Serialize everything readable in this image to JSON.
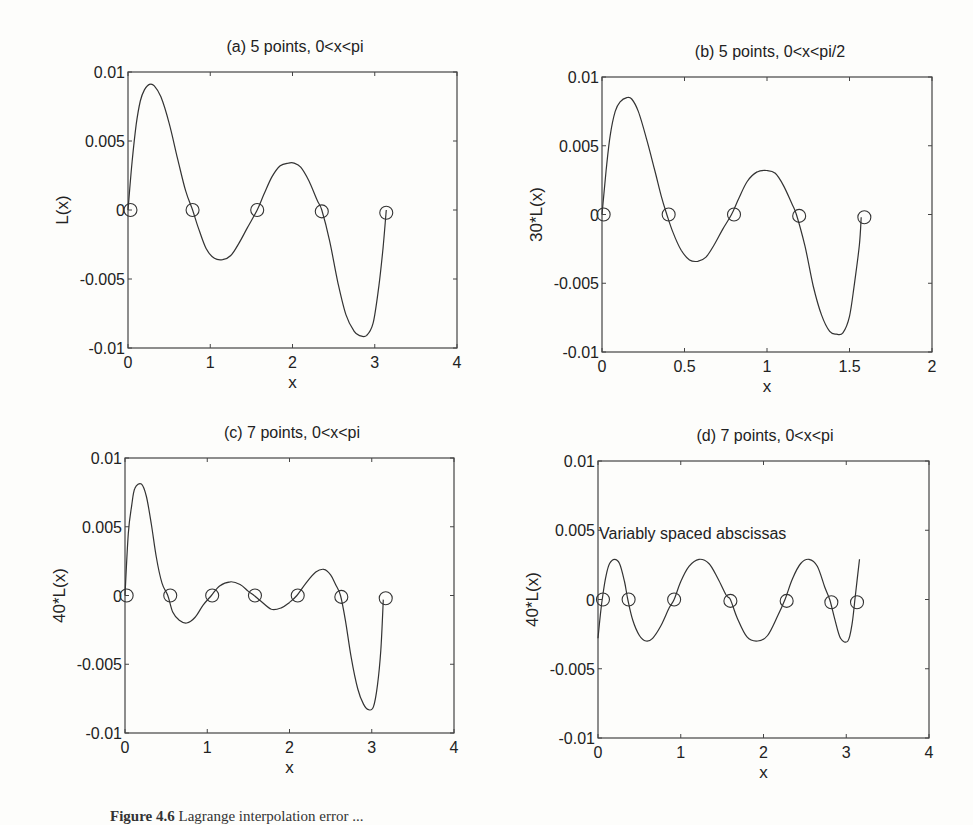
{
  "chart_data": [
    {
      "id": "a",
      "type": "line",
      "title": "(a) 5 points, 0<x<pi",
      "xlabel": "x",
      "ylabel": "L(x)",
      "xlim": [
        0,
        4
      ],
      "ylim": [
        -0.01,
        0.01
      ],
      "xticks": [
        0,
        1,
        2,
        3,
        4
      ],
      "xtick_labels": [
        "0",
        "1",
        "2",
        "3",
        "4"
      ],
      "yticks": [
        -0.01,
        -0.005,
        0,
        0.005,
        0.01
      ],
      "ytick_labels": [
        "-0.01",
        "-0.005",
        "0",
        "0.005",
        "0.01"
      ],
      "grid": false,
      "box": {
        "left": 128,
        "top": 72,
        "right": 457,
        "bottom": 348
      },
      "title_pos": {
        "x": 295,
        "y": 52
      },
      "series": [
        {
          "name": "L(x)",
          "style": "line",
          "points": [
            [
              0,
              0
            ],
            [
              0.05,
              0.0035
            ],
            [
              0.1,
              0.0062
            ],
            [
              0.15,
              0.0079
            ],
            [
              0.2,
              0.0087
            ],
            [
              0.26,
              0.0091
            ],
            [
              0.32,
              0.009
            ],
            [
              0.4,
              0.0082
            ],
            [
              0.5,
              0.0063
            ],
            [
              0.6,
              0.0038
            ],
            [
              0.7,
              0.0014
            ],
            [
              0.785,
              0
            ],
            [
              0.85,
              -0.0012
            ],
            [
              0.95,
              -0.0028
            ],
            [
              1.05,
              -0.0035
            ],
            [
              1.15,
              -0.0036
            ],
            [
              1.25,
              -0.0033
            ],
            [
              1.35,
              -0.0024
            ],
            [
              1.45,
              -0.0013
            ],
            [
              1.571,
              0
            ],
            [
              1.65,
              0.0011
            ],
            [
              1.75,
              0.0024
            ],
            [
              1.85,
              0.0032
            ],
            [
              1.95,
              0.0034
            ],
            [
              2.02,
              0.0034
            ],
            [
              2.1,
              0.0031
            ],
            [
              2.2,
              0.0021
            ],
            [
              2.3,
              0.0007
            ],
            [
              2.356,
              0
            ],
            [
              2.45,
              -0.0022
            ],
            [
              2.55,
              -0.0052
            ],
            [
              2.65,
              -0.0076
            ],
            [
              2.75,
              -0.0088
            ],
            [
              2.82,
              -0.0091
            ],
            [
              2.9,
              -0.0091
            ],
            [
              2.98,
              -0.0082
            ],
            [
              3.05,
              -0.0055
            ],
            [
              3.1,
              -0.0028
            ],
            [
              3.14,
              0
            ]
          ]
        },
        {
          "name": "nodes",
          "style": "marker-circle",
          "points": [
            [
              0.03,
              0
            ],
            [
              0.785,
              0
            ],
            [
              1.571,
              0
            ],
            [
              2.356,
              -0.0001
            ],
            [
              3.14,
              -0.0002
            ]
          ]
        }
      ]
    },
    {
      "id": "b",
      "type": "line",
      "title": "(b) 5 points, 0<x<pi/2",
      "xlabel": "x",
      "ylabel": "30*L(x)",
      "xlim": [
        0,
        2
      ],
      "ylim": [
        -0.01,
        0.01
      ],
      "xticks": [
        0,
        0.5,
        1,
        1.5,
        2
      ],
      "xtick_labels": [
        "0",
        "0.5",
        "1",
        "1.5",
        "2"
      ],
      "yticks": [
        -0.01,
        -0.005,
        0,
        0.005,
        0.01
      ],
      "ytick_labels": [
        "-0.01",
        "-0.005",
        "0",
        "0.005",
        "0.01"
      ],
      "grid": false,
      "box": {
        "left": 602,
        "top": 77,
        "right": 932,
        "bottom": 352
      },
      "title_pos": {
        "x": 770,
        "y": 57
      },
      "series": [
        {
          "name": "30*L(x)",
          "style": "line",
          "points": [
            [
              0,
              0
            ],
            [
              0.025,
              0.0032
            ],
            [
              0.05,
              0.0058
            ],
            [
              0.08,
              0.0075
            ],
            [
              0.11,
              0.0082
            ],
            [
              0.15,
              0.0085
            ],
            [
              0.18,
              0.0084
            ],
            [
              0.22,
              0.0075
            ],
            [
              0.27,
              0.0055
            ],
            [
              0.32,
              0.0032
            ],
            [
              0.36,
              0.0013
            ],
            [
              0.393,
              0
            ],
            [
              0.43,
              -0.0013
            ],
            [
              0.48,
              -0.0026
            ],
            [
              0.53,
              -0.0033
            ],
            [
              0.58,
              -0.0034
            ],
            [
              0.63,
              -0.0031
            ],
            [
              0.68,
              -0.0022
            ],
            [
              0.73,
              -0.0011
            ],
            [
              0.785,
              0
            ],
            [
              0.83,
              0.0012
            ],
            [
              0.88,
              0.0024
            ],
            [
              0.94,
              0.0031
            ],
            [
              1.0,
              0.0032
            ],
            [
              1.05,
              0.003
            ],
            [
              1.1,
              0.0021
            ],
            [
              1.15,
              0.0008
            ],
            [
              1.178,
              0
            ],
            [
              1.23,
              -0.0023
            ],
            [
              1.28,
              -0.0052
            ],
            [
              1.33,
              -0.0073
            ],
            [
              1.38,
              -0.0085
            ],
            [
              1.42,
              -0.0087
            ],
            [
              1.46,
              -0.0086
            ],
            [
              1.5,
              -0.0074
            ],
            [
              1.53,
              -0.005
            ],
            [
              1.56,
              -0.0022
            ],
            [
              1.571,
              -0.0002
            ]
          ]
        },
        {
          "name": "nodes",
          "style": "marker-circle",
          "points": [
            [
              0.01,
              0
            ],
            [
              0.404,
              0
            ],
            [
              0.8,
              0
            ],
            [
              1.195,
              -0.0001
            ],
            [
              1.59,
              -0.0002
            ]
          ]
        }
      ]
    },
    {
      "id": "c",
      "type": "line",
      "title": "(c) 7 points, 0<x<pi",
      "xlabel": "x",
      "ylabel": "40*L(x)",
      "xlim": [
        0,
        4
      ],
      "ylim": [
        -0.01,
        0.01
      ],
      "xticks": [
        0,
        1,
        2,
        3,
        4
      ],
      "xtick_labels": [
        "0",
        "1",
        "2",
        "3",
        "4"
      ],
      "yticks": [
        -0.01,
        -0.005,
        0,
        0.005,
        0.01
      ],
      "ytick_labels": [
        "-0.01",
        "-0.005",
        "0",
        "0.005",
        "0.01"
      ],
      "grid": false,
      "box": {
        "left": 125,
        "top": 458,
        "right": 454,
        "bottom": 733
      },
      "title_pos": {
        "x": 292,
        "y": 438
      },
      "series": [
        {
          "name": "40*L(x)",
          "style": "line",
          "points": [
            [
              0,
              0
            ],
            [
              0.04,
              0.0045
            ],
            [
              0.08,
              0.0065
            ],
            [
              0.12,
              0.0078
            ],
            [
              0.2,
              0.0081
            ],
            [
              0.26,
              0.0072
            ],
            [
              0.32,
              0.0052
            ],
            [
              0.38,
              0.0028
            ],
            [
              0.45,
              0.0009
            ],
            [
              0.52,
              0
            ],
            [
              0.58,
              -0.0012
            ],
            [
              0.66,
              -0.0018
            ],
            [
              0.75,
              -0.002
            ],
            [
              0.85,
              -0.0016
            ],
            [
              0.95,
              -0.0007
            ],
            [
              1.05,
              0
            ],
            [
              1.15,
              0.0007
            ],
            [
              1.28,
              0.001
            ],
            [
              1.4,
              0.0008
            ],
            [
              1.5,
              0.0003
            ],
            [
              1.57,
              0
            ],
            [
              1.65,
              -0.0004
            ],
            [
              1.78,
              -0.001
            ],
            [
              1.9,
              -0.0009
            ],
            [
              2.0,
              -0.0005
            ],
            [
              2.09,
              0
            ],
            [
              2.2,
              0.0009
            ],
            [
              2.32,
              0.0017
            ],
            [
              2.42,
              0.0019
            ],
            [
              2.5,
              0.0015
            ],
            [
              2.56,
              0.0008
            ],
            [
              2.62,
              0
            ],
            [
              2.68,
              -0.0018
            ],
            [
              2.75,
              -0.0045
            ],
            [
              2.83,
              -0.0068
            ],
            [
              2.9,
              -0.0079
            ],
            [
              2.96,
              -0.0083
            ],
            [
              3.02,
              -0.0081
            ],
            [
              3.07,
              -0.0065
            ],
            [
              3.11,
              -0.004
            ],
            [
              3.14,
              -0.0003
            ]
          ]
        },
        {
          "name": "nodes",
          "style": "marker-circle",
          "points": [
            [
              0.02,
              0
            ],
            [
              0.55,
              0
            ],
            [
              1.06,
              0
            ],
            [
              1.58,
              0
            ],
            [
              2.1,
              0
            ],
            [
              2.63,
              -0.0001
            ],
            [
              3.17,
              -0.0002
            ]
          ]
        }
      ]
    },
    {
      "id": "d",
      "type": "line",
      "title": "(d) 7 points, 0<x<pi",
      "xlabel": "x",
      "ylabel": "40*L(x)",
      "xlim": [
        0,
        4
      ],
      "ylim": [
        -0.01,
        0.01
      ],
      "xticks": [
        0,
        1,
        2,
        3,
        4
      ],
      "xtick_labels": [
        "0",
        "1",
        "2",
        "3",
        "4"
      ],
      "yticks": [
        -0.01,
        -0.005,
        0,
        0.005,
        0.01
      ],
      "ytick_labels": [
        "-0.01",
        "-0.005",
        "0",
        "0.005",
        "0.01"
      ],
      "grid": false,
      "annotation": {
        "text": "Variably spaced abscissas",
        "x": 0.0,
        "y": 0.0048
      },
      "box": {
        "left": 598,
        "top": 461,
        "right": 929,
        "bottom": 738
      },
      "title_pos": {
        "x": 765,
        "y": 441
      },
      "series": [
        {
          "name": "40*L(x)",
          "style": "line",
          "points": [
            [
              0,
              -0.0028
            ],
            [
              0.03,
              -0.001
            ],
            [
              0.06,
              0.0004
            ],
            [
              0.1,
              0.0018
            ],
            [
              0.14,
              0.0026
            ],
            [
              0.2,
              0.0029
            ],
            [
              0.26,
              0.0026
            ],
            [
              0.32,
              0.0013
            ],
            [
              0.36,
              0
            ],
            [
              0.42,
              -0.0015
            ],
            [
              0.5,
              -0.0026
            ],
            [
              0.58,
              -0.003
            ],
            [
              0.66,
              -0.0028
            ],
            [
              0.76,
              -0.0019
            ],
            [
              0.86,
              -0.0006
            ],
            [
              0.92,
              0
            ],
            [
              1.0,
              0.0013
            ],
            [
              1.1,
              0.0024
            ],
            [
              1.22,
              0.0029
            ],
            [
              1.34,
              0.0026
            ],
            [
              1.45,
              0.0015
            ],
            [
              1.55,
              0.0003
            ],
            [
              1.6,
              0
            ],
            [
              1.68,
              -0.0013
            ],
            [
              1.8,
              -0.0027
            ],
            [
              1.93,
              -0.003
            ],
            [
              2.05,
              -0.0026
            ],
            [
              2.17,
              -0.0012
            ],
            [
              2.26,
              0
            ],
            [
              2.35,
              0.0015
            ],
            [
              2.45,
              0.0026
            ],
            [
              2.55,
              0.0029
            ],
            [
              2.65,
              0.0024
            ],
            [
              2.74,
              0.0009
            ],
            [
              2.8,
              0
            ],
            [
              2.86,
              -0.0014
            ],
            [
              2.93,
              -0.0028
            ],
            [
              3.02,
              -0.003
            ],
            [
              3.07,
              -0.0018
            ],
            [
              3.11,
              0.0003
            ],
            [
              3.16,
              0.0029
            ]
          ]
        },
        {
          "name": "nodes",
          "style": "marker-circle",
          "points": [
            [
              0.06,
              0
            ],
            [
              0.37,
              0
            ],
            [
              0.92,
              0
            ],
            [
              1.6,
              -0.0001
            ],
            [
              2.28,
              -0.0001
            ],
            [
              2.82,
              -0.0002
            ],
            [
              3.13,
              -0.0002
            ]
          ]
        }
      ]
    }
  ],
  "caption": {
    "label": "Figure 4.6",
    "text": "Lagrange interpolation error ..."
  }
}
